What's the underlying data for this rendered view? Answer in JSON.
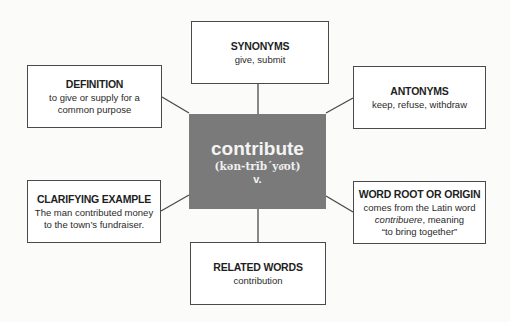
{
  "center": {
    "word": "contribute",
    "pronunciation": "(kən-trĭb´yo͞ot)",
    "part_of_speech": "v.",
    "fill_color": "#7a7a7a"
  },
  "boxes": {
    "synonyms": {
      "title": "SYNONYMS",
      "lines": [
        "give, submit"
      ]
    },
    "definition": {
      "title": "DEFINITION",
      "lines": [
        "to give or supply for a",
        "common purpose"
      ]
    },
    "antonyms": {
      "title": "ANTONYMS",
      "lines": [
        "keep, refuse, withdraw"
      ]
    },
    "clarifying_example": {
      "title": "CLARIFYING EXAMPLE",
      "lines": [
        "The man contributed money",
        "to the town’s fundraiser."
      ]
    },
    "word_root": {
      "title": "WORD ROOT OR ORIGIN",
      "line1": "comes from the Latin word",
      "italic_word": "contribuere",
      "line2_rest": ", meaning",
      "line3": "“to bring together”"
    },
    "related_words": {
      "title": "RELATED WORDS",
      "lines": [
        "contribution"
      ]
    }
  }
}
